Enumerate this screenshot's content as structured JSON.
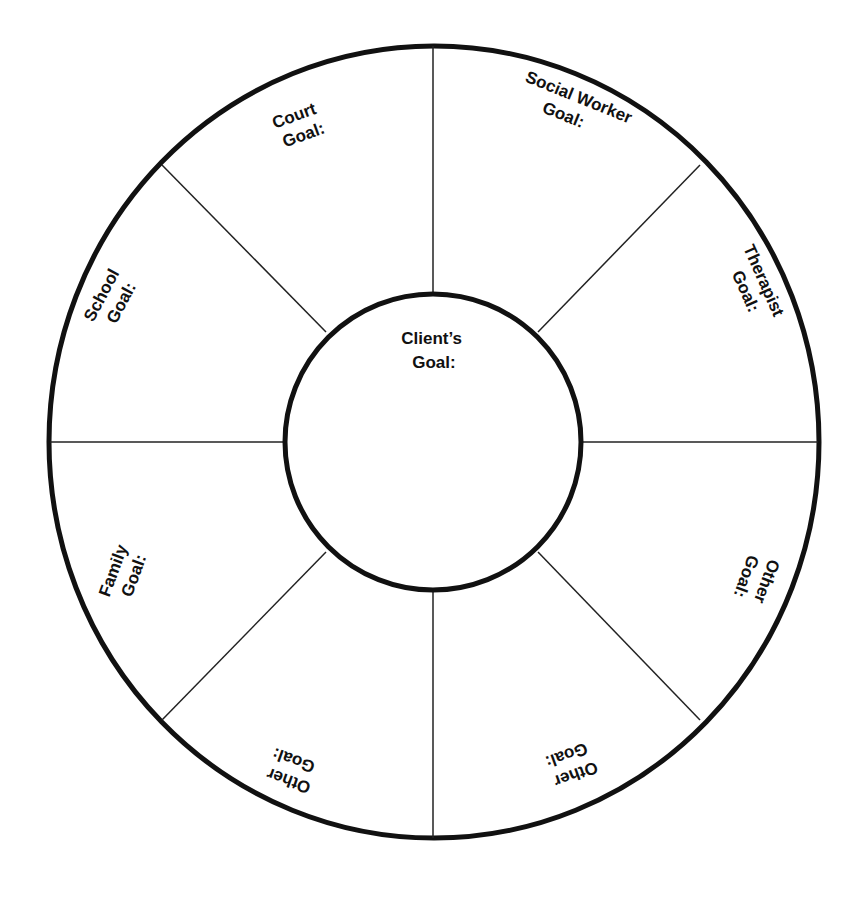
{
  "diagram": {
    "colors": {
      "stroke": "#111111",
      "background": "#ffffff",
      "text": "#111111"
    },
    "center": {
      "label_line1": "Client’s",
      "label_line2": "Goal:"
    },
    "segments": [
      {
        "id": "court",
        "line1": "Court",
        "line2": "Goal:"
      },
      {
        "id": "social-worker",
        "line1": "Social Worker",
        "line2": "Goal:"
      },
      {
        "id": "therapist",
        "line1": "Therapist",
        "line2": "Goal:"
      },
      {
        "id": "other-right",
        "line1": "Other",
        "line2": "Goal:"
      },
      {
        "id": "other-bottom-right",
        "line1": "Other",
        "line2": "Goal:"
      },
      {
        "id": "other-bottom-left",
        "line1": "Other",
        "line2": "Goal:"
      },
      {
        "id": "family",
        "line1": "Family",
        "line2": "Goal:"
      },
      {
        "id": "school",
        "line1": "School",
        "line2": "Goal:"
      }
    ]
  }
}
